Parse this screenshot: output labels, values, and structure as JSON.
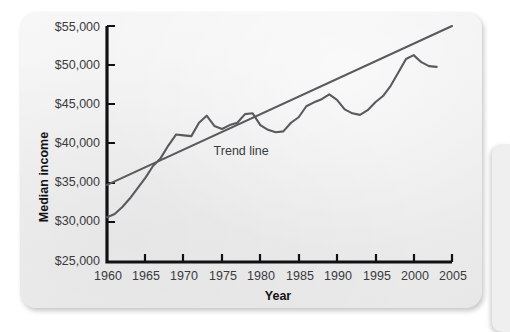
{
  "figure": {
    "background_color": "#efeff0",
    "axis_color": "#111113",
    "series_color": "#5a5a5e",
    "trend_color": "#5a5a5e"
  },
  "chart_data": {
    "type": "line",
    "title": "",
    "xlabel": "Year",
    "ylabel": "Median income",
    "xlim": [
      1960,
      2005
    ],
    "ylim": [
      25000,
      55000
    ],
    "xticks": [
      1960,
      1965,
      1970,
      1975,
      1980,
      1985,
      1990,
      1995,
      2000,
      2005
    ],
    "xtick_labels": [
      "1960",
      "1965",
      "1970",
      "1975",
      "1980",
      "1985",
      "1990",
      "1995",
      "2000",
      "2005"
    ],
    "yticks": [
      25000,
      30000,
      35000,
      40000,
      45000,
      50000,
      55000
    ],
    "ytick_labels": [
      "$25,000",
      "$30,000",
      "$35,000",
      "$40,000",
      "$45,000",
      "$50,000",
      "$55,000"
    ],
    "grid": false,
    "legend_position": "inline-annotation",
    "annotations": [
      {
        "text": "Trend line",
        "x": 1977.5,
        "y": 38600
      }
    ],
    "series": [
      {
        "name": "Median income",
        "type": "line",
        "x": [
          1960,
          1961,
          1962,
          1963,
          1964,
          1965,
          1966,
          1967,
          1968,
          1969,
          1970,
          1971,
          1972,
          1973,
          1974,
          1975,
          1976,
          1977,
          1978,
          1979,
          1980,
          1981,
          1982,
          1983,
          1984,
          1985,
          1986,
          1987,
          1988,
          1989,
          1990,
          1991,
          1992,
          1993,
          1994,
          1995,
          1996,
          1997,
          1998,
          1999,
          2000,
          2001,
          2002,
          2003
        ],
        "values": [
          30700,
          31100,
          32000,
          33100,
          34400,
          35700,
          37200,
          38200,
          39800,
          41200,
          41100,
          41000,
          42700,
          43600,
          42300,
          41900,
          42400,
          42700,
          43800,
          43900,
          42400,
          41800,
          41500,
          41600,
          42700,
          43400,
          44800,
          45300,
          45700,
          46300,
          45600,
          44400,
          43900,
          43700,
          44300,
          45300,
          46100,
          47400,
          49100,
          50800,
          51300,
          50400,
          49900,
          49800
        ]
      },
      {
        "name": "Trend line",
        "type": "line",
        "x": [
          1960,
          2005
        ],
        "values": [
          34800,
          55000
        ]
      }
    ]
  },
  "axis_titles": {
    "x": "Year",
    "y": "Median income"
  }
}
